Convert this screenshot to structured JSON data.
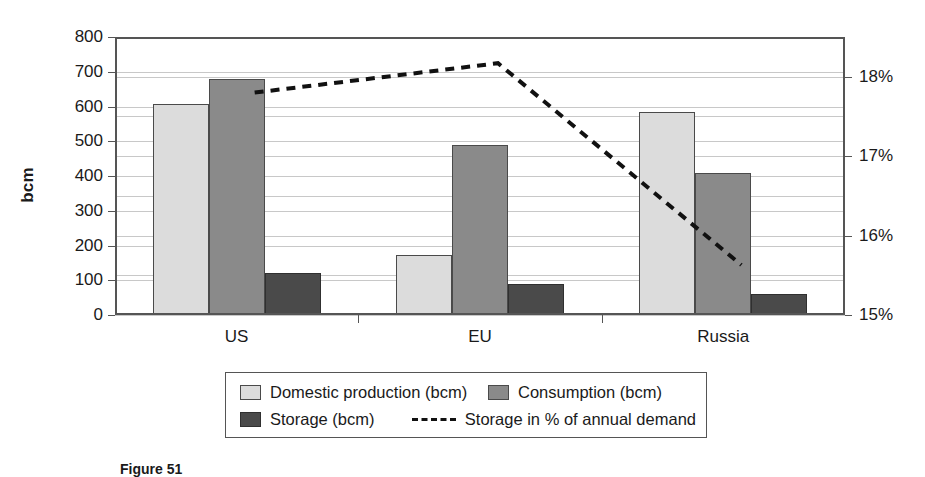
{
  "chart_data": {
    "type": "bar",
    "title": "",
    "xlabel": "",
    "ylabel": "bcm",
    "categories": [
      "US",
      "EU",
      "Russia"
    ],
    "ylim": [
      0,
      800
    ],
    "y_ticks": [
      "0",
      "100",
      "200",
      "300",
      "400",
      "500",
      "600",
      "700",
      "800"
    ],
    "y2_label": "",
    "y2lim": [
      15,
      18.5
    ],
    "y2_ticks": [
      "15%",
      "16%",
      "17%",
      "18%"
    ],
    "grid": true,
    "legend_position": "bottom",
    "series": [
      {
        "name": "Domestic production (bcm)",
        "type": "bar",
        "color": "#dcdcdc",
        "values": [
          608,
          173,
          585
        ]
      },
      {
        "name": "Consumption (bcm)",
        "type": "bar",
        "color": "#8a8a8a",
        "values": [
          680,
          488,
          410
        ]
      },
      {
        "name": "Storage (bcm)",
        "type": "bar",
        "color": "#4a4a4a",
        "values": [
          120,
          88,
          60
        ]
      },
      {
        "name": "Storage in % of annual demand",
        "type": "line",
        "axis": "y2",
        "color": "#111111",
        "dash": true,
        "values": [
          17.8,
          18.17,
          15.63
        ]
      }
    ]
  },
  "axis": {
    "y_title": "bcm",
    "y_ticks": [
      "800",
      "700",
      "600",
      "500",
      "400",
      "300",
      "200",
      "100",
      "0"
    ],
    "y2_ticks": [
      "18%",
      "17%",
      "16%",
      "15%"
    ],
    "categories": [
      "US",
      "EU",
      "Russia"
    ]
  },
  "legend": {
    "items": [
      {
        "label": "Domestic production (bcm)",
        "marker": "swatch-light"
      },
      {
        "label": "Consumption (bcm)",
        "marker": "swatch-medium"
      },
      {
        "label": "Storage (bcm)",
        "marker": "swatch-dark"
      },
      {
        "label": "Storage in % of annual demand",
        "marker": "dashed-line"
      }
    ]
  },
  "caption": {
    "text": "Figure 51"
  }
}
